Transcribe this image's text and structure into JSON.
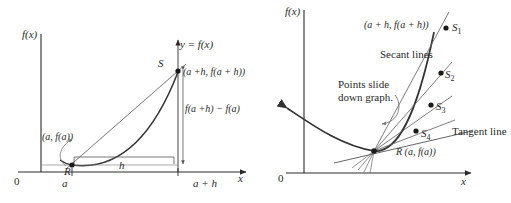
{
  "figure": {
    "background": "#ffffff",
    "ink": "#2a2a2a"
  },
  "left_panel": {
    "name": "secant-line-difference-quotient",
    "axis": {
      "y_label": "f(x)",
      "x_label": "x",
      "origin_label": "0"
    },
    "curve_label": "y = f(x)",
    "points": {
      "R_letter": "R",
      "R_coords": "(a, f(a))",
      "S_letter": "S",
      "S_coords": "(a +h, f(a + h))"
    },
    "measures": {
      "vertical_rise": "f(a +h) − f(a)",
      "horizontal_run": "h"
    },
    "ticks": {
      "a": "a",
      "a_plus_h": "a + h"
    }
  },
  "right_panel": {
    "name": "secant-lines-sliding-to-tangent",
    "axis": {
      "y_label": "f(x)",
      "x_label": "x",
      "origin_label": "0"
    },
    "annotations": {
      "secant_lines": "Secant lines",
      "points_slide_line1": "Points slide",
      "points_slide_line2": "down graph.",
      "tangent_line": "Tangent line"
    },
    "points": {
      "top_coords": "(a + h, f(a + h))",
      "S1": "S",
      "S1_sub": "1",
      "S2": "S",
      "S2_sub": "2",
      "S3": "S",
      "S3_sub": "3",
      "S4": "S",
      "S4_sub": "4",
      "R_label": "R (a, f(a))"
    }
  }
}
